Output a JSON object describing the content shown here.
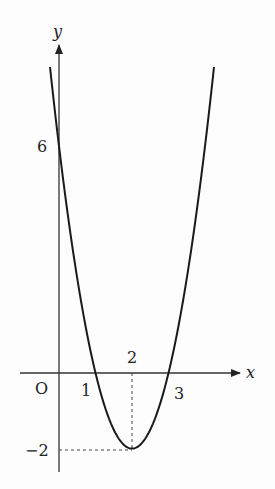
{
  "figure": {
    "function": "y = 2x^2 - 8x + 6",
    "axis_labels": {
      "x": "x",
      "y": "y",
      "origin": "O"
    },
    "x_ticks": [
      {
        "value": 1,
        "label": "1"
      },
      {
        "value": 2,
        "label": "2"
      },
      {
        "value": 3,
        "label": "3"
      }
    ],
    "y_ticks": [
      {
        "value": 6,
        "label": "6"
      },
      {
        "value": -2,
        "label": "−2"
      }
    ],
    "vertex": {
      "x": 2,
      "y": -2
    },
    "roots": [
      1,
      3
    ],
    "y_intercept": 6,
    "colors": {
      "curve": "#1a1a1a",
      "axes": "#333333",
      "guides": "#444444"
    }
  }
}
